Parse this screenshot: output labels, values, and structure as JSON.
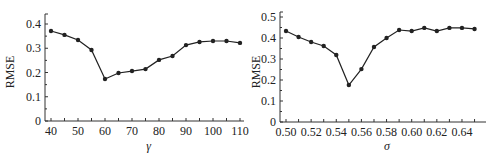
{
  "chart_data": [
    {
      "type": "line",
      "title": "",
      "xlabel": "γ",
      "ylabel": "RMSE",
      "x": [
        40,
        45,
        50,
        55,
        60,
        65,
        70,
        75,
        80,
        85,
        90,
        95,
        100,
        105,
        110
      ],
      "series": [
        {
          "name": "RMSE",
          "values": [
            0.371,
            0.355,
            0.334,
            0.293,
            0.173,
            0.198,
            0.206,
            0.214,
            0.252,
            0.268,
            0.313,
            0.326,
            0.33,
            0.33,
            0.322
          ]
        }
      ],
      "xticks": [
        40,
        50,
        60,
        70,
        80,
        90,
        100,
        110
      ],
      "xtick_labels": [
        "40",
        "50",
        "60",
        "70",
        "80",
        "90",
        "100",
        "110"
      ],
      "yticks": [
        0,
        0.1,
        0.2,
        0.3,
        0.4
      ],
      "ytick_labels": [
        "0",
        "0.1",
        "0.2",
        "0.3",
        "0.4"
      ],
      "xlim": [
        38,
        112
      ],
      "ylim": [
        0,
        0.42
      ],
      "grid": false,
      "legend": "none",
      "marker": "filled-circle",
      "color": "#222222"
    },
    {
      "type": "line",
      "title": "",
      "xlabel": "σ",
      "ylabel": "RMSE",
      "x": [
        0.5,
        0.51,
        0.52,
        0.53,
        0.54,
        0.55,
        0.56,
        0.57,
        0.58,
        0.59,
        0.6,
        0.61,
        0.62,
        0.63,
        0.64,
        0.65
      ],
      "series": [
        {
          "name": "RMSE",
          "values": [
            0.433,
            0.405,
            0.381,
            0.362,
            0.319,
            0.176,
            0.252,
            0.357,
            0.4,
            0.438,
            0.433,
            0.448,
            0.433,
            0.448,
            0.448,
            0.443
          ]
        }
      ],
      "xticks": [
        0.5,
        0.52,
        0.54,
        0.56,
        0.58,
        0.6,
        0.62,
        0.64
      ],
      "xtick_labels": [
        "0.50",
        "0.52",
        "0.54",
        "0.56",
        "0.58",
        "0.60",
        "0.62",
        "0.64"
      ],
      "yticks": [
        0,
        0.1,
        0.2,
        0.3,
        0.4,
        0.5
      ],
      "ytick_labels": [
        "0",
        "0.1",
        "0.2",
        "0.3",
        "0.4",
        "0.5"
      ],
      "xlim": [
        0.495,
        0.656
      ],
      "ylim": [
        0,
        0.5
      ],
      "grid": false,
      "legend": "none",
      "marker": "filled-circle",
      "color": "#222222"
    }
  ]
}
